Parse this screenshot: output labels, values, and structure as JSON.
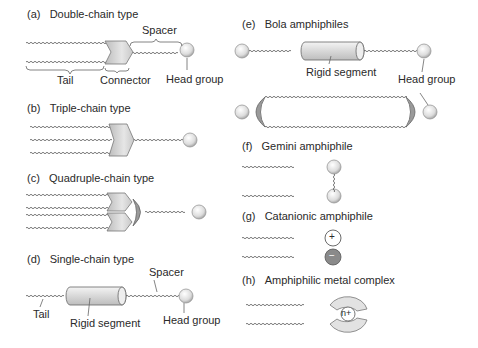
{
  "panels": {
    "a": {
      "tag": "(a)",
      "title": "Double-chain type",
      "labels": {
        "spacer": "Spacer",
        "tail": "Tail",
        "connector": "Connector",
        "head": "Head group"
      }
    },
    "b": {
      "tag": "(b)",
      "title": "Triple-chain type"
    },
    "c": {
      "tag": "(c)",
      "title": "Quadruple-chain type"
    },
    "d": {
      "tag": "(d)",
      "title": "Single-chain type",
      "labels": {
        "spacer": "Spacer",
        "tail": "Tail",
        "rigid": "Rigid segment",
        "head": "Head group"
      }
    },
    "e": {
      "tag": "(e)",
      "title": "Bola amphiphiles",
      "labels": {
        "rigid": "Rigid segment",
        "head": "Head group"
      }
    },
    "f": {
      "tag": "(f)",
      "title": "Gemini amphiphile"
    },
    "g": {
      "tag": "(g)",
      "title": "Catanionic amphiphile",
      "labels": {
        "plus": "+",
        "minus": "−"
      }
    },
    "h": {
      "tag": "(h)",
      "title": "Amphiphilic metal complex",
      "labels": {
        "ion": "n+"
      }
    }
  },
  "colors": {
    "line": "#555555",
    "connector": "#cfcfcf",
    "head": "#e4e4e4",
    "cap": "#9a9a9a",
    "anion": "#8a8a8a"
  }
}
